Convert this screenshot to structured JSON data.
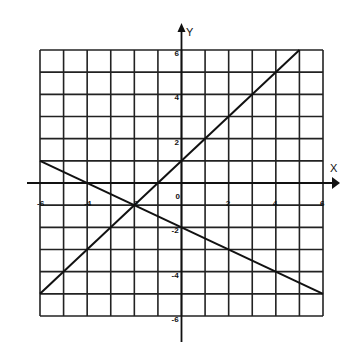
{
  "chart_data": {
    "type": "line",
    "title": "",
    "xlabel": "X",
    "ylabel": "Y",
    "xlim": [
      -6,
      6
    ],
    "ylim": [
      -6,
      6
    ],
    "grid": true,
    "grid_step": 1,
    "x_tick_labels": [
      "-6",
      "-4",
      "-2",
      "0",
      "2",
      "4",
      "6"
    ],
    "y_tick_labels": [
      "6",
      "4",
      "2",
      "-2",
      "-4",
      "-6"
    ],
    "series": [
      {
        "name": "y = x + 1",
        "x": [
          -6,
          5
        ],
        "y": [
          -5,
          6
        ]
      },
      {
        "name": "y = -0.5x - 2",
        "x": [
          -6,
          6
        ],
        "y": [
          1,
          -5
        ]
      }
    ],
    "annotations": [
      {
        "type": "intersection",
        "x": -2,
        "y": -1
      }
    ],
    "colors": {
      "line": "#111111",
      "grid": "#222222",
      "background": "#ffffff"
    }
  }
}
